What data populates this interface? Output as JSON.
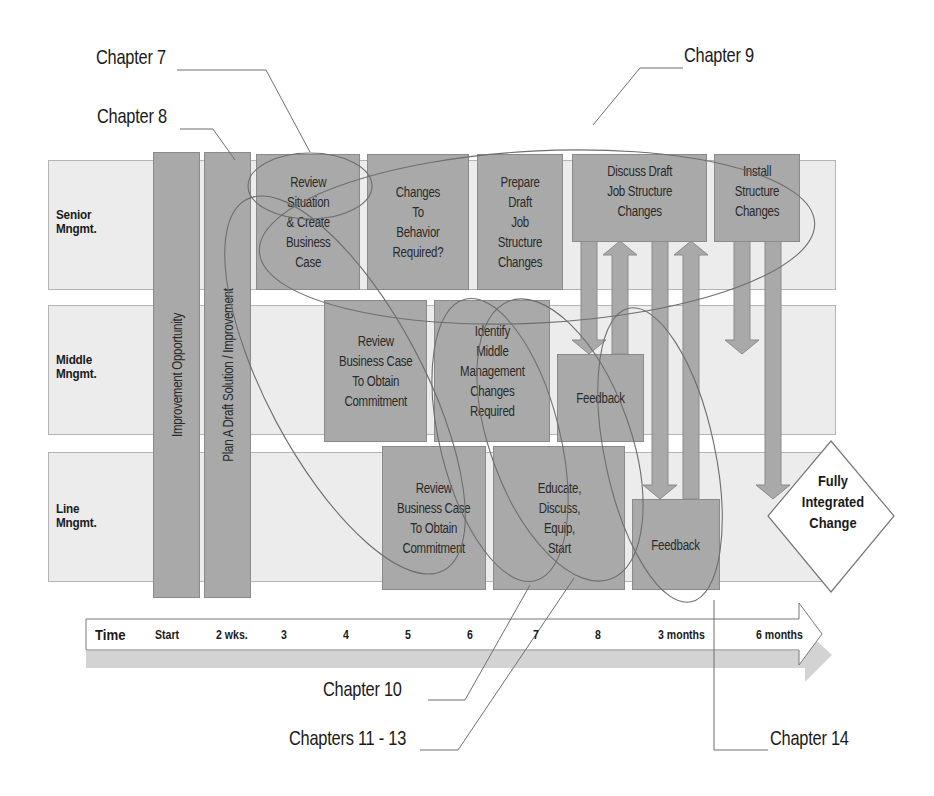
{
  "lanes": [
    {
      "label": "Senior\nMngmt.",
      "label_line1": "Senior",
      "label_line2": "Mngmt."
    },
    {
      "label": "Middle\nMngmt.",
      "label_line1": "Middle",
      "label_line2": "Mngmt."
    },
    {
      "label": "Line\nMngmt.",
      "label_line1": "Line",
      "label_line2": "Mngmt."
    }
  ],
  "vertical_bars": [
    {
      "label": "Improvement Opportunity"
    },
    {
      "label": "Plan A Draft Solution / Improvement"
    }
  ],
  "boxes": {
    "senior": [
      {
        "label": "Review\nSituation\n& Create\nBusiness\nCase"
      },
      {
        "label": "Changes\nTo\nBehavior\nRequired?"
      },
      {
        "label": "Prepare\nDraft\nJob\nStructure\nChanges"
      },
      {
        "label": "Discuss Draft\nJob Structure\nChanges"
      },
      {
        "label": "Install\nStructure\nChanges"
      }
    ],
    "middle": [
      {
        "label": "Review\nBusiness Case\nTo Obtain\nCommitment"
      },
      {
        "label": "Identify\nMiddle\nManagement\nChanges\nRequired"
      },
      {
        "label": "Feedback"
      }
    ],
    "line": [
      {
        "label": "Review\nBusiness Case\nTo Obtain\nCommitment"
      },
      {
        "label": "Educate,\nDiscuss,\nEquip,\nStart"
      },
      {
        "label": "Feedback"
      }
    ]
  },
  "final": {
    "label": "Fully\nIntegrated\nChange"
  },
  "timeline": {
    "title": "Time",
    "ticks": [
      "Start",
      "2 wks.",
      "3",
      "4",
      "5",
      "6",
      "7",
      "8",
      "3 months",
      "6 months"
    ]
  },
  "chapters": {
    "ch7": "Chapter 7",
    "ch8": "Chapter 8",
    "ch9": "Chapter 9",
    "ch10": "Chapter 10",
    "ch11_13": "Chapters 11 - 13",
    "ch14": "Chapter 14"
  },
  "colors": {
    "box_fill": "#a9a9a9",
    "lane_fill": "#ececec",
    "callout_line": "#6e6e6e",
    "text": "#1a1a1a"
  }
}
